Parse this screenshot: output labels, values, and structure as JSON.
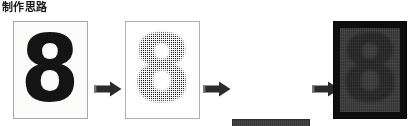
{
  "slide": {
    "title": "制作思路",
    "background_color": "#ffffff"
  },
  "pipeline": {
    "description": "Four-stage image processing progression of the numeral 8",
    "arrow_color": "#2b2b2b",
    "arrow_icon": "arrow-right-block",
    "stages": [
      {
        "index": 1,
        "glyph": "8",
        "state": "original-solid",
        "background_color": "#fbfbfa",
        "glyph_color": "#141414",
        "border_color": "#a8a8a8"
      },
      {
        "index": 2,
        "glyph": "8",
        "state": "halftone-dithered",
        "background_color": "#fdfdfc",
        "glyph_color": "#1b1b1b",
        "border_color": "#b0b0ad"
      },
      {
        "index": 3,
        "glyph": "8",
        "state": "darkened-low-contrast",
        "background_color": "#3c3c3c",
        "glyph_color": "#262626",
        "border_color": "#2e2e2e"
      },
      {
        "index": 4,
        "glyph": "8",
        "state": "framed-dark",
        "background_color": "#3a3a3a",
        "glyph_color": "#252525",
        "border_color": "#0e0e0e"
      }
    ],
    "arrows": [
      {
        "index": 1,
        "label": "→"
      },
      {
        "index": 2,
        "label": "→"
      },
      {
        "index": 3,
        "label": "→"
      }
    ]
  }
}
